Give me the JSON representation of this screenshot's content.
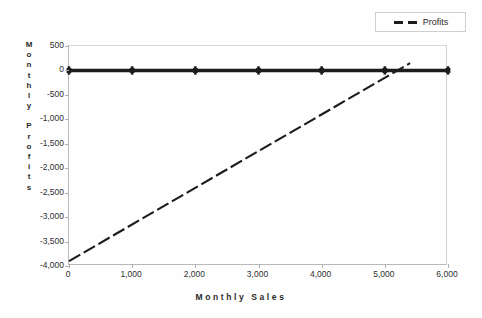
{
  "figure": {
    "background_color": "#fefefe",
    "ink_color": "#1c1c1c",
    "axis_color": "#b9b9b9"
  },
  "legend": {
    "position": "top-right",
    "entries": [
      {
        "label": "Profits",
        "style": "dashed",
        "color": "#1c1c1c"
      }
    ]
  },
  "axis_titles": {
    "y": "Monthly Profits",
    "y_stacked": [
      "M",
      "o",
      "n",
      "t",
      "h",
      "l",
      "y",
      "",
      "P",
      "r",
      "o",
      "f",
      "i",
      "t",
      "s"
    ],
    "x": "Monthly Sales"
  },
  "ticks": {
    "y": [
      "500",
      "0",
      "-500",
      "-1,000",
      "-1,500",
      "-2,000",
      "-2,500",
      "-3,000",
      "-3,500",
      "-4,000"
    ],
    "y_values": [
      500,
      0,
      -500,
      -1000,
      -1500,
      -2000,
      -2500,
      -3000,
      -3500,
      -4000
    ],
    "x": [
      "0",
      "1,000",
      "2,000",
      "3,000",
      "4,000",
      "5,000",
      "6,000"
    ],
    "x_values": [
      0,
      1000,
      2000,
      3000,
      4000,
      5000,
      6000
    ]
  },
  "chart_data": {
    "type": "line",
    "title": "",
    "subtitle": "",
    "xlabel": "Monthly Sales",
    "ylabel": "Monthly Profits",
    "xlim": [
      0,
      6000
    ],
    "ylim": [
      -4000,
      500
    ],
    "grid": false,
    "legend_position": "top-right",
    "x": [
      0,
      1000,
      2000,
      3000,
      4000,
      5000,
      6000
    ],
    "series": [
      {
        "name": "Breakeven",
        "style": "solid-thick-with-cross-markers",
        "color": "#1c1c1c",
        "in_legend": false,
        "values": [
          0,
          0,
          0,
          0,
          0,
          0,
          0
        ]
      },
      {
        "name": "Profits",
        "style": "dashed",
        "color": "#1c1c1c",
        "in_legend": true,
        "values": [
          -3900,
          -3225,
          -2550,
          -1875,
          -1200,
          -525,
          150
        ],
        "x_intercept": 5200,
        "y_intercept": -3900,
        "slope_per_unit_sales": 0.675,
        "segment_end_x": 5400,
        "segment_end_y": 150
      }
    ],
    "annotations": []
  }
}
